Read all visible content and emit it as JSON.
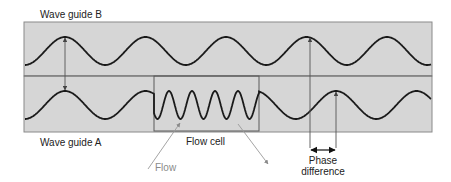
{
  "labels": {
    "wave_guide_b": "Wave guide B",
    "wave_guide_a": "Wave guide A",
    "flow_cell": "Flow cell",
    "flow": "Flow",
    "phase_line1": "Phase",
    "phase_line2": "difference"
  },
  "colors": {
    "panel_fill": "#d6d6d6",
    "panel_border": "#7a7a7a",
    "wave_stroke": "#1a1a1a",
    "arrow_stroke": "#555555",
    "flow_arrow": "#9a9a9a"
  },
  "diagram": {
    "outer_box": {
      "x": 24,
      "y": 22,
      "w": 408,
      "h": 110
    },
    "divider_y": 76,
    "flow_cell_box": {
      "x1": 154,
      "x2": 259,
      "y1": 76,
      "y2": 131
    },
    "wave_b": {
      "center_y": 51,
      "amplitude": 14,
      "period": 80.5,
      "first_peak_x": 65
    },
    "wave_a": {
      "center_y": 105,
      "amplitude": 14,
      "period": 80.5,
      "first_peak_x": 65,
      "cell_period": 23,
      "post_cell_peak_x": 336
    },
    "phase_difference": {
      "x_left": 310,
      "x_right": 336
    }
  }
}
